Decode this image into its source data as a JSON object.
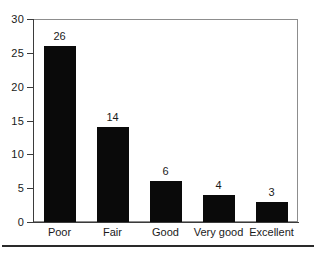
{
  "chart_data": {
    "type": "bar",
    "title": "",
    "subtitle": "",
    "xlabel": "",
    "ylabel": "",
    "categories": [
      "Poor",
      "Fair",
      "Good",
      "Very good",
      "Excellent"
    ],
    "values": [
      26,
      14,
      6,
      4,
      3
    ],
    "data_labels": [
      "26",
      "14",
      "6",
      "4",
      "3"
    ],
    "ylim": [
      0,
      30
    ],
    "y_ticks": [
      0,
      5,
      10,
      15,
      20,
      25,
      30
    ],
    "y_tick_labels": [
      "0",
      "5",
      "10",
      "15",
      "20",
      "25",
      "30"
    ],
    "grid": false,
    "legend": false,
    "legend_position": "none",
    "bar_color": "#0a0a0a",
    "plot_background": "#ffffff",
    "axis_color": "#3b3b3b",
    "frame_color": "#8d8d8d"
  },
  "axis": {
    "y_ticks": [
      {
        "label": "30",
        "value": 30
      },
      {
        "label": "25",
        "value": 25
      },
      {
        "label": "20",
        "value": 20
      },
      {
        "label": "15",
        "value": 15
      },
      {
        "label": "10",
        "value": 10
      },
      {
        "label": "5",
        "value": 5
      },
      {
        "label": "0",
        "value": 0
      }
    ]
  },
  "bars": [
    {
      "category": "Poor",
      "value": 26,
      "label": "26"
    },
    {
      "category": "Fair",
      "value": 14,
      "label": "14"
    },
    {
      "category": "Good",
      "value": 6,
      "label": "6"
    },
    {
      "category": "Very good",
      "value": 4,
      "label": "4"
    },
    {
      "category": "Excellent",
      "value": 3,
      "label": "3"
    }
  ]
}
